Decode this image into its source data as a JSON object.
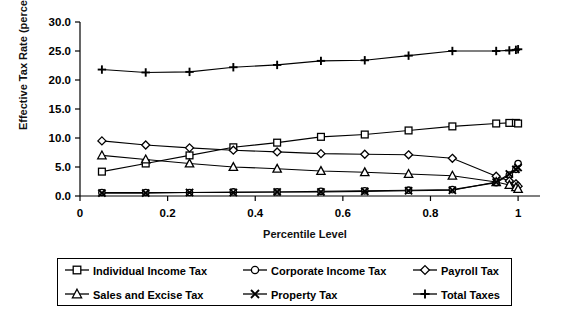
{
  "chart_data": {
    "type": "line",
    "title": "",
    "xlabel": "Percentile Level",
    "ylabel": "Effective Tax Rate (percent)",
    "xlim": [
      0,
      1.05
    ],
    "ylim": [
      0,
      30
    ],
    "xticks": [
      "0",
      "0.2",
      "0.4",
      "0.6",
      "0.8",
      "1"
    ],
    "xtick_values": [
      0,
      0.2,
      0.4,
      0.6,
      0.8,
      1
    ],
    "yticks": [
      "0.0",
      "5.0",
      "10.0",
      "15.0",
      "20.0",
      "25.0",
      "30.0"
    ],
    "ytick_values": [
      0,
      5,
      10,
      15,
      20,
      25,
      30
    ],
    "grid": false,
    "legend_position": "bottom",
    "x": [
      0.05,
      0.15,
      0.25,
      0.35,
      0.45,
      0.55,
      0.65,
      0.75,
      0.85,
      0.95,
      0.98,
      0.995,
      1.0
    ],
    "series": [
      {
        "name": "Individual Income Tax",
        "marker": "square",
        "values": [
          4.2,
          5.6,
          7.0,
          8.4,
          9.2,
          10.2,
          10.6,
          11.3,
          12.0,
          12.5,
          12.6,
          12.6,
          12.5
        ]
      },
      {
        "name": "Corporate Income Tax",
        "marker": "circle",
        "values": [
          0.6,
          0.6,
          0.6,
          0.7,
          0.7,
          0.8,
          0.9,
          1.0,
          1.1,
          2.3,
          3.6,
          4.6,
          5.6
        ]
      },
      {
        "name": "Payroll Tax",
        "marker": "diamond",
        "values": [
          9.5,
          8.8,
          8.3,
          7.9,
          7.6,
          7.3,
          7.2,
          7.1,
          6.5,
          3.4,
          2.6,
          2.1,
          1.7
        ]
      },
      {
        "name": "Sales and Excise Tax",
        "marker": "triangle",
        "values": [
          7.0,
          6.3,
          5.6,
          5.0,
          4.7,
          4.3,
          4.1,
          3.8,
          3.5,
          2.4,
          1.9,
          1.5,
          1.2
        ]
      },
      {
        "name": "Property Tax",
        "marker": "cross-x",
        "values": [
          0.5,
          0.5,
          0.6,
          0.6,
          0.7,
          0.7,
          0.8,
          0.9,
          1.0,
          2.4,
          3.8,
          4.6,
          4.9
        ]
      },
      {
        "name": "Total Taxes",
        "marker": "plus",
        "values": [
          21.8,
          21.3,
          21.4,
          22.2,
          22.6,
          23.3,
          23.4,
          24.2,
          25.0,
          25.0,
          25.1,
          25.2,
          25.3
        ]
      }
    ]
  },
  "legend": {
    "entries": [
      {
        "label": "Individual Income Tax",
        "marker": "square"
      },
      {
        "label": "Corporate Income Tax",
        "marker": "circle"
      },
      {
        "label": "Payroll Tax",
        "marker": "diamond"
      },
      {
        "label": "Sales and Excise Tax",
        "marker": "triangle"
      },
      {
        "label": "Property Tax",
        "marker": "cross-x"
      },
      {
        "label": "Total Taxes",
        "marker": "plus"
      }
    ]
  },
  "colors": {
    "line": "#000000",
    "axis": "#000000",
    "background": "#ffffff"
  }
}
